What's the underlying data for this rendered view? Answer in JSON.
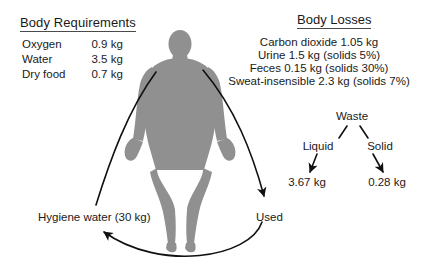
{
  "canvas": {
    "width": 432,
    "height": 280,
    "background": "#ffffff"
  },
  "colors": {
    "text": "#1a1a1a",
    "rule": "#4a4a4a",
    "silhouette": "#909090",
    "arrow": "#111111"
  },
  "requirements": {
    "title": "Body Requirements",
    "rows": [
      {
        "label": "Oxygen",
        "value": "0.9 kg"
      },
      {
        "label": "Water",
        "value": "3.5 kg"
      },
      {
        "label": "Dry food",
        "value": "0.7 kg"
      }
    ]
  },
  "losses": {
    "title": "Body Losses",
    "lines": [
      "Carbon dioxide 1.05 kg",
      "Urine 1.5 kg (solids 5%)",
      "Feces 0.15 kg (solids 30%)",
      "Sweat-insensible 2.3 kg (solids 7%)"
    ]
  },
  "waste_tree": {
    "root": "Waste",
    "branches": [
      {
        "label": "Liquid",
        "value": "3.67 kg"
      },
      {
        "label": "Solid",
        "value": "0.28 kg"
      }
    ]
  },
  "flow": {
    "hygiene_label": "Hygiene water (30 kg)",
    "used_label": "Used"
  },
  "figure": {
    "name": "human-body-silhouette"
  }
}
